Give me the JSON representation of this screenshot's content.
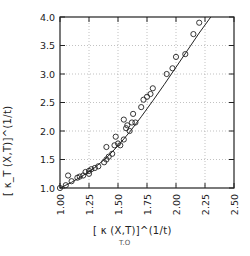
{
  "chart_data": {
    "type": "scatter",
    "title": "",
    "xlabel": "[ κ_T,O (X,T)]^(1/t)",
    "xlabel_main": "[  κ   (X,T)]^(1/t)",
    "xlabel_subscript": "T.O",
    "ylabel": "[ κ_T (X,T)]^(1/t)",
    "xlim": [
      1.0,
      2.5
    ],
    "ylim": [
      1.0,
      4.0
    ],
    "x_ticks": [
      "1.00",
      "1.25",
      "1.50",
      "1.75",
      "2.00",
      "2.25",
      "2.50"
    ],
    "y_ticks": [
      "1.0",
      "1.5",
      "2.0",
      "2.5",
      "3.0",
      "3.5",
      "4.0"
    ],
    "grid": true,
    "legend": null,
    "series": [
      {
        "name": "data",
        "marker": "open-circle",
        "points": [
          [
            1.0,
            1.0
          ],
          [
            1.05,
            1.05
          ],
          [
            1.07,
            1.22
          ],
          [
            1.1,
            1.12
          ],
          [
            1.15,
            1.18
          ],
          [
            1.17,
            1.2
          ],
          [
            1.2,
            1.22
          ],
          [
            1.22,
            1.28
          ],
          [
            1.25,
            1.25
          ],
          [
            1.25,
            1.3
          ],
          [
            1.27,
            1.33
          ],
          [
            1.3,
            1.35
          ],
          [
            1.33,
            1.38
          ],
          [
            1.38,
            1.45
          ],
          [
            1.4,
            1.5
          ],
          [
            1.4,
            1.72
          ],
          [
            1.42,
            1.55
          ],
          [
            1.45,
            1.6
          ],
          [
            1.47,
            1.75
          ],
          [
            1.48,
            1.9
          ],
          [
            1.5,
            1.78
          ],
          [
            1.52,
            1.75
          ],
          [
            1.55,
            1.85
          ],
          [
            1.55,
            2.2
          ],
          [
            1.57,
            2.05
          ],
          [
            1.58,
            2.1
          ],
          [
            1.6,
            2.0
          ],
          [
            1.62,
            2.15
          ],
          [
            1.63,
            2.3
          ],
          [
            1.65,
            2.15
          ],
          [
            1.7,
            2.42
          ],
          [
            1.72,
            2.55
          ],
          [
            1.75,
            2.6
          ],
          [
            1.78,
            2.65
          ],
          [
            1.8,
            2.75
          ],
          [
            1.92,
            3.0
          ],
          [
            1.97,
            3.1
          ],
          [
            2.0,
            3.3
          ],
          [
            2.08,
            3.35
          ],
          [
            2.15,
            3.7
          ],
          [
            2.2,
            3.9
          ]
        ]
      },
      {
        "name": "fit",
        "marker": "line",
        "points": [
          [
            1.0,
            1.0
          ],
          [
            1.1,
            1.1
          ],
          [
            1.2,
            1.22
          ],
          [
            1.3,
            1.36
          ],
          [
            1.4,
            1.53
          ],
          [
            1.5,
            1.74
          ],
          [
            1.6,
            1.98
          ],
          [
            1.7,
            2.25
          ],
          [
            1.8,
            2.53
          ],
          [
            1.9,
            2.82
          ],
          [
            2.0,
            3.12
          ],
          [
            2.1,
            3.42
          ],
          [
            2.2,
            3.72
          ],
          [
            2.3,
            4.0
          ]
        ]
      }
    ]
  },
  "colors": {
    "axis": "#222222",
    "grid": "#999999",
    "marker": "#222222",
    "background": "#ffffff"
  }
}
